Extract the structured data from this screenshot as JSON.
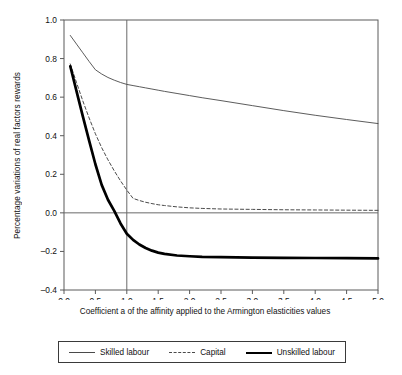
{
  "chart_data": {
    "type": "line",
    "title": "",
    "xlabel": "Coefficient a of the affinity applied to the Armington elasticities values",
    "ylabel": "Percentage variations of real factors rewards",
    "xlim": [
      0.0,
      5.0
    ],
    "ylim": [
      -0.4,
      1.0
    ],
    "xticks": [
      "0.0",
      "0.5",
      "1.0",
      "1.5",
      "2.0",
      "2.5",
      "3.0",
      "3.5",
      "4.0",
      "4.5",
      "5.0"
    ],
    "xtick_values": [
      0.0,
      0.5,
      1.0,
      1.5,
      2.0,
      2.5,
      3.0,
      3.5,
      4.0,
      4.5,
      5.0
    ],
    "yticks": [
      "1.0",
      "0.8",
      "0.6",
      "0.4",
      "0.2",
      "0.0",
      "-0.2",
      "-0.4"
    ],
    "ytick_values": [
      1.0,
      0.8,
      0.6,
      0.4,
      0.2,
      0.0,
      -0.2,
      -0.4
    ],
    "grid": false,
    "legend_position": "below",
    "reference_lines": [
      {
        "axis": "x",
        "value": 1.0
      },
      {
        "axis": "y",
        "value": 0.0
      }
    ],
    "x": [
      0.1,
      0.2,
      0.3,
      0.4,
      0.5,
      0.6,
      0.7,
      0.8,
      0.9,
      1.0,
      1.1,
      1.2,
      1.3,
      1.4,
      1.5,
      1.6,
      1.8,
      2.0,
      2.2,
      2.5,
      3.0,
      3.5,
      4.0,
      4.5,
      5.0
    ],
    "series": [
      {
        "name": "Skilled labour",
        "style": "solid-thin",
        "color": "#4a4a4a",
        "values": [
          0.92,
          0.875,
          0.83,
          0.785,
          0.742,
          0.72,
          0.702,
          0.688,
          0.676,
          0.666,
          0.66,
          0.654,
          0.648,
          0.642,
          0.636,
          0.63,
          0.619,
          0.608,
          0.597,
          0.582,
          0.556,
          0.53,
          0.506,
          0.484,
          0.463
        ]
      },
      {
        "name": "Capital",
        "style": "dashed",
        "color": "#4a4a4a",
        "values": [
          0.772,
          0.675,
          0.58,
          0.492,
          0.41,
          0.338,
          0.275,
          0.218,
          0.166,
          0.118,
          0.075,
          0.064,
          0.055,
          0.048,
          0.042,
          0.038,
          0.031,
          0.026,
          0.023,
          0.02,
          0.018,
          0.016,
          0.015,
          0.014,
          0.013
        ]
      },
      {
        "name": "Unskilled labour",
        "style": "solid-thick",
        "color": "#000000",
        "values": [
          0.76,
          0.63,
          0.5,
          0.375,
          0.252,
          0.145,
          0.068,
          0.01,
          -0.055,
          -0.108,
          -0.14,
          -0.164,
          -0.182,
          -0.196,
          -0.206,
          -0.213,
          -0.221,
          -0.225,
          -0.228,
          -0.23,
          -0.232,
          -0.233,
          -0.234,
          -0.235,
          -0.236
        ]
      }
    ]
  },
  "legend": {
    "items": [
      {
        "label": "Skilled labour"
      },
      {
        "label": "Capital"
      },
      {
        "label": "Unskilled labour"
      }
    ]
  }
}
